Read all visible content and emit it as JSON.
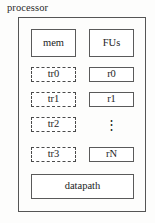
{
  "diagram": {
    "caption": "processor",
    "container_label": "processor",
    "blocks": {
      "mem": "mem",
      "fus": "FUs",
      "datapath": "datapath"
    },
    "left_column": [
      {
        "label": "tr0",
        "style": "dashed"
      },
      {
        "label": "tr1",
        "style": "dashed"
      },
      {
        "label": "tr2",
        "style": "dashed"
      },
      {
        "label": "tr3",
        "style": "dashed"
      }
    ],
    "right_column": [
      {
        "label": "r0",
        "style": "solid"
      },
      {
        "label": "r1",
        "style": "solid"
      },
      {
        "label": "⋮",
        "style": "none"
      },
      {
        "label": "rN",
        "style": "solid"
      }
    ],
    "colors": {
      "background": "#fdfdfc",
      "outline": "#555555",
      "block_outline": "#5a5a5a",
      "dashed_outline": "#4a4a4a",
      "text": "#1d1d1d"
    }
  }
}
